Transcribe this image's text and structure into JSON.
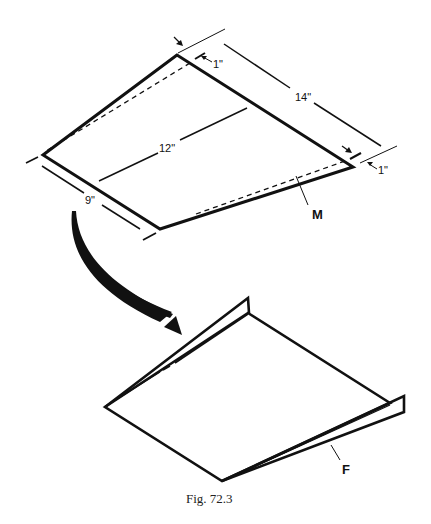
{
  "figure": {
    "caption": "Fig. 72.3",
    "top_view": {
      "dimensions": {
        "length_top": "14\"",
        "length_center": "12\"",
        "width_left": "9\"",
        "margin_top": "1\"",
        "margin_right": "1\""
      },
      "label": "M"
    },
    "bottom_view": {
      "label": "F"
    },
    "colors": {
      "ink": "#111111",
      "background": "#ffffff"
    }
  }
}
